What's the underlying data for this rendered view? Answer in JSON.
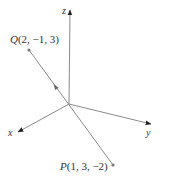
{
  "diagram": {
    "type": "3d-coordinate-system",
    "origin": {
      "x": 69,
      "y": 104
    },
    "colors": {
      "axis": "#8a8a8a",
      "segment": "#8a8a8a",
      "arrowhead": "#222222",
      "label": "#333333",
      "point": "#777777"
    },
    "axes": [
      {
        "name": "z",
        "label": "z",
        "tip": {
          "x": 70,
          "y": 9
        },
        "label_pos": {
          "x": 64,
          "y": 13
        }
      },
      {
        "name": "x",
        "label": "x",
        "tip": {
          "x": 17,
          "y": 133
        },
        "label_pos": {
          "x": 9,
          "y": 136
        }
      },
      {
        "name": "y",
        "label": "y",
        "tip": {
          "x": 152,
          "y": 124
        },
        "label_pos": {
          "x": 146,
          "y": 136
        }
      }
    ],
    "points": [
      {
        "name": "Q",
        "label_letter": "Q",
        "label_coords": "(2, −1, 3)",
        "coords": [
          2,
          -1,
          3
        ],
        "pos": {
          "x": 29,
          "y": 50
        },
        "label_pos": {
          "x": 10,
          "y": 43
        }
      },
      {
        "name": "P",
        "label_letter": "P",
        "label_coords": "(1, 3, −2)",
        "coords": [
          1,
          3,
          -2
        ],
        "pos": {
          "x": 113,
          "y": 165
        },
        "label_pos": {
          "x": 60,
          "y": 170
        }
      }
    ],
    "segment": {
      "from": "P",
      "to": "Q",
      "direction_arrow": {
        "x": 55,
        "y": 86
      }
    }
  }
}
